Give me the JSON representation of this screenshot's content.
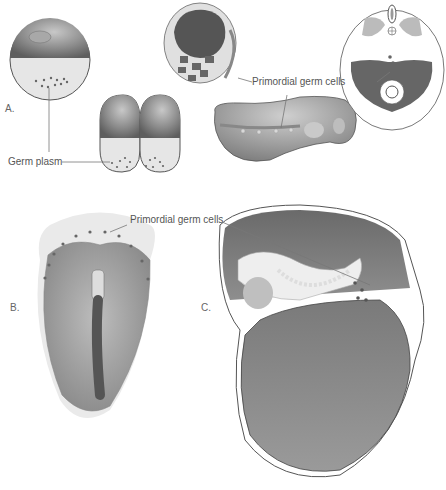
{
  "figure": {
    "panels": [
      {
        "id": "A",
        "label": "A.",
        "description": "Frog egg and 2-cell stage with germ plasm; blastula section and tailbud embryo; cross-section showing primordial germ cells"
      },
      {
        "id": "B",
        "label": "B.",
        "description": "Chick blastoderm with primordial germ cells in germinal crescent"
      },
      {
        "id": "C",
        "label": "C.",
        "description": "Mammalian embryo sagittal section with primordial germ cells migrating along hindgut"
      }
    ],
    "annotations": {
      "germ_plasm": "Germ plasm",
      "pgc_a": "Primordial germ cells",
      "pgc_bc": "Primordial germ cells"
    },
    "colors": {
      "background": "#ffffff",
      "dark_gray": "#6e6e6e",
      "mid_gray": "#9a9a9a",
      "light_gray": "#d9d9d9",
      "leader_line": "#777777"
    }
  }
}
